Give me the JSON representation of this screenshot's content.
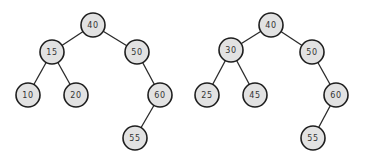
{
  "diagram": {
    "type": "binary-search-trees",
    "node_radius": 12,
    "colors": {
      "node_fill": "#e2e2e2",
      "node_stroke": "#1e1e1e",
      "edge": "#2a2a2a",
      "label": "#333333"
    },
    "trees": [
      {
        "name": "left-tree",
        "nodes": [
          {
            "id": "n40",
            "label": "40",
            "x": 93,
            "y": 25
          },
          {
            "id": "n15",
            "label": "15",
            "x": 52,
            "y": 52
          },
          {
            "id": "n50",
            "label": "50",
            "x": 137,
            "y": 52
          },
          {
            "id": "n10",
            "label": "10",
            "x": 28,
            "y": 95
          },
          {
            "id": "n20",
            "label": "20",
            "x": 76,
            "y": 95
          },
          {
            "id": "n60",
            "label": "60",
            "x": 160,
            "y": 95
          },
          {
            "id": "n55",
            "label": "55",
            "x": 135,
            "y": 138
          }
        ],
        "edges": [
          {
            "from": "n40",
            "to": "n15"
          },
          {
            "from": "n40",
            "to": "n50"
          },
          {
            "from": "n15",
            "to": "n10"
          },
          {
            "from": "n15",
            "to": "n20"
          },
          {
            "from": "n50",
            "to": "n60"
          },
          {
            "from": "n60",
            "to": "n55"
          }
        ]
      },
      {
        "name": "right-tree",
        "nodes": [
          {
            "id": "m40",
            "label": "40",
            "x": 271,
            "y": 25
          },
          {
            "id": "m30",
            "label": "30",
            "x": 231,
            "y": 50
          },
          {
            "id": "m50",
            "label": "50",
            "x": 312,
            "y": 52
          },
          {
            "id": "m25",
            "label": "25",
            "x": 207,
            "y": 95
          },
          {
            "id": "m45",
            "label": "45",
            "x": 255,
            "y": 95
          },
          {
            "id": "m60",
            "label": "60",
            "x": 336,
            "y": 95
          },
          {
            "id": "m55",
            "label": "55",
            "x": 313,
            "y": 138
          }
        ],
        "edges": [
          {
            "from": "m40",
            "to": "m30"
          },
          {
            "from": "m40",
            "to": "m50"
          },
          {
            "from": "m30",
            "to": "m25"
          },
          {
            "from": "m30",
            "to": "m45"
          },
          {
            "from": "m50",
            "to": "m60"
          },
          {
            "from": "m60",
            "to": "m55"
          }
        ]
      }
    ]
  }
}
